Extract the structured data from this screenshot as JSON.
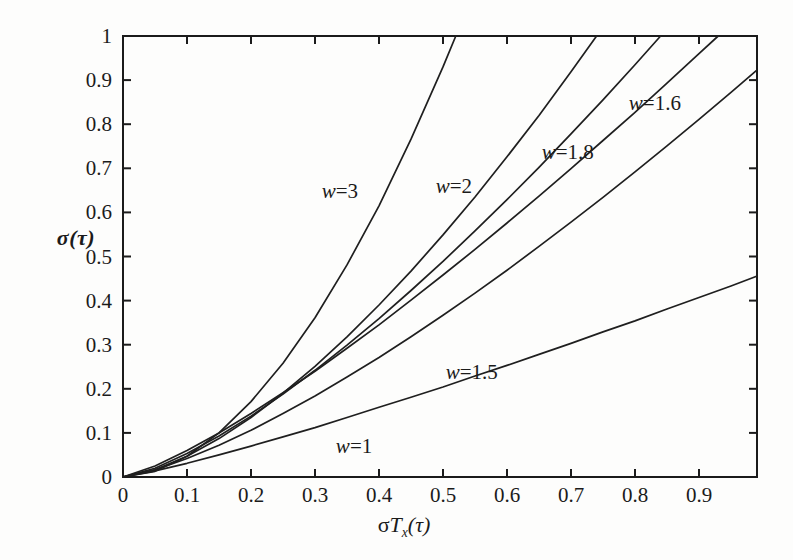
{
  "figure": {
    "background": "#fdfdfc",
    "ink_color": "#1b1b1b",
    "curve_color": "#1f1f1f"
  },
  "chart_data": {
    "type": "line",
    "title": "",
    "xlabel": "σTx(τ)",
    "xlabel_parts": {
      "sigma": "σ",
      "T": "T",
      "sub": "x",
      "tau": "(τ)"
    },
    "ylabel": "σ(τ)",
    "xlim": [
      0,
      0.99
    ],
    "ylim": [
      0,
      1
    ],
    "grid": false,
    "legend_position": "inline-curve-labels",
    "x_ticks": [
      {
        "v": 0,
        "label": "0"
      },
      {
        "v": 0.1,
        "label": "0.1"
      },
      {
        "v": 0.2,
        "label": "0.2"
      },
      {
        "v": 0.3,
        "label": "0.3"
      },
      {
        "v": 0.4,
        "label": "0.4"
      },
      {
        "v": 0.5,
        "label": "0.5"
      },
      {
        "v": 0.6,
        "label": "0.6"
      },
      {
        "v": 0.7,
        "label": "0.7"
      },
      {
        "v": 0.8,
        "label": "0.8"
      },
      {
        "v": 0.9,
        "label": "0.9"
      }
    ],
    "y_ticks": [
      {
        "v": 0,
        "label": "0"
      },
      {
        "v": 0.1,
        "label": "0.1"
      },
      {
        "v": 0.2,
        "label": "0.2"
      },
      {
        "v": 0.3,
        "label": "0.3"
      },
      {
        "v": 0.4,
        "label": "0.4"
      },
      {
        "v": 0.5,
        "label": "0.5"
      },
      {
        "v": 0.6,
        "label": "0.6"
      },
      {
        "v": 0.7,
        "label": "0.7"
      },
      {
        "v": 0.8,
        "label": "0.8"
      },
      {
        "v": 0.9,
        "label": "0.9"
      },
      {
        "v": 1,
        "label": "1"
      }
    ],
    "series": [
      {
        "name": "w=3",
        "label": "w=3",
        "label_at": {
          "x": 0.339,
          "y": 0.648
        },
        "points": [
          [
            0,
            0
          ],
          [
            0.05,
            0.013
          ],
          [
            0.1,
            0.047
          ],
          [
            0.15,
            0.1
          ],
          [
            0.2,
            0.171
          ],
          [
            0.25,
            0.258
          ],
          [
            0.3,
            0.361
          ],
          [
            0.35,
            0.481
          ],
          [
            0.4,
            0.615
          ],
          [
            0.45,
            0.766
          ],
          [
            0.5,
            0.93
          ],
          [
            0.52,
            1.0
          ]
        ]
      },
      {
        "name": "w=2",
        "label": "w=2",
        "label_at": {
          "x": 0.517,
          "y": 0.659
        },
        "points": [
          [
            0,
            0
          ],
          [
            0.05,
            0.016
          ],
          [
            0.1,
            0.047
          ],
          [
            0.15,
            0.087
          ],
          [
            0.2,
            0.135
          ],
          [
            0.25,
            0.19
          ],
          [
            0.3,
            0.251
          ],
          [
            0.35,
            0.318
          ],
          [
            0.4,
            0.39
          ],
          [
            0.45,
            0.467
          ],
          [
            0.5,
            0.549
          ],
          [
            0.55,
            0.635
          ],
          [
            0.6,
            0.726
          ],
          [
            0.65,
            0.82
          ],
          [
            0.7,
            0.919
          ],
          [
            0.74,
            1.0
          ]
        ]
      },
      {
        "name": "w=1.8",
        "label": "w=1.8",
        "label_at": {
          "x": 0.695,
          "y": 0.736
        },
        "points": [
          [
            0,
            0
          ],
          [
            0.05,
            0.02
          ],
          [
            0.1,
            0.053
          ],
          [
            0.15,
            0.093
          ],
          [
            0.2,
            0.138
          ],
          [
            0.25,
            0.188
          ],
          [
            0.3,
            0.242
          ],
          [
            0.35,
            0.299
          ],
          [
            0.4,
            0.359
          ],
          [
            0.45,
            0.423
          ],
          [
            0.5,
            0.489
          ],
          [
            0.55,
            0.558
          ],
          [
            0.6,
            0.629
          ],
          [
            0.65,
            0.702
          ],
          [
            0.7,
            0.778
          ],
          [
            0.75,
            0.855
          ],
          [
            0.8,
            0.935
          ],
          [
            0.84,
            1.0
          ]
        ]
      },
      {
        "name": "w=1.6",
        "label": "w=1.6",
        "label_at": {
          "x": 0.831,
          "y": 0.848
        },
        "points": [
          [
            0,
            0
          ],
          [
            0.05,
            0.025
          ],
          [
            0.1,
            0.06
          ],
          [
            0.15,
            0.1
          ],
          [
            0.2,
            0.144
          ],
          [
            0.25,
            0.191
          ],
          [
            0.3,
            0.24
          ],
          [
            0.35,
            0.292
          ],
          [
            0.4,
            0.345
          ],
          [
            0.45,
            0.401
          ],
          [
            0.5,
            0.458
          ],
          [
            0.55,
            0.516
          ],
          [
            0.6,
            0.576
          ],
          [
            0.65,
            0.637
          ],
          [
            0.7,
            0.699
          ],
          [
            0.75,
            0.763
          ],
          [
            0.8,
            0.827
          ],
          [
            0.85,
            0.893
          ],
          [
            0.9,
            0.96
          ],
          [
            0.93,
            1.0
          ]
        ]
      },
      {
        "name": "w=1.5",
        "label": "w=1.5",
        "label_at": {
          "x": 0.545,
          "y": 0.239
        },
        "points": [
          [
            0,
            0
          ],
          [
            0.05,
            0.016
          ],
          [
            0.1,
            0.042
          ],
          [
            0.15,
            0.072
          ],
          [
            0.2,
            0.106
          ],
          [
            0.25,
            0.144
          ],
          [
            0.3,
            0.184
          ],
          [
            0.35,
            0.227
          ],
          [
            0.4,
            0.271
          ],
          [
            0.45,
            0.318
          ],
          [
            0.5,
            0.367
          ],
          [
            0.55,
            0.417
          ],
          [
            0.6,
            0.469
          ],
          [
            0.65,
            0.523
          ],
          [
            0.7,
            0.578
          ],
          [
            0.75,
            0.634
          ],
          [
            0.8,
            0.692
          ],
          [
            0.85,
            0.751
          ],
          [
            0.9,
            0.811
          ],
          [
            0.95,
            0.872
          ],
          [
            0.99,
            0.922
          ]
        ]
      },
      {
        "name": "w=1",
        "label": "w=1",
        "label_at": {
          "x": 0.361,
          "y": 0.07
        },
        "points": [
          [
            0,
            0
          ],
          [
            0.05,
            0.014
          ],
          [
            0.1,
            0.031
          ],
          [
            0.15,
            0.05
          ],
          [
            0.2,
            0.07
          ],
          [
            0.25,
            0.091
          ],
          [
            0.3,
            0.112
          ],
          [
            0.35,
            0.135
          ],
          [
            0.4,
            0.158
          ],
          [
            0.45,
            0.181
          ],
          [
            0.5,
            0.204
          ],
          [
            0.55,
            0.229
          ],
          [
            0.6,
            0.253
          ],
          [
            0.65,
            0.278
          ],
          [
            0.7,
            0.303
          ],
          [
            0.75,
            0.329
          ],
          [
            0.8,
            0.354
          ],
          [
            0.85,
            0.381
          ],
          [
            0.9,
            0.407
          ],
          [
            0.95,
            0.433
          ],
          [
            0.99,
            0.455
          ]
        ]
      }
    ]
  }
}
